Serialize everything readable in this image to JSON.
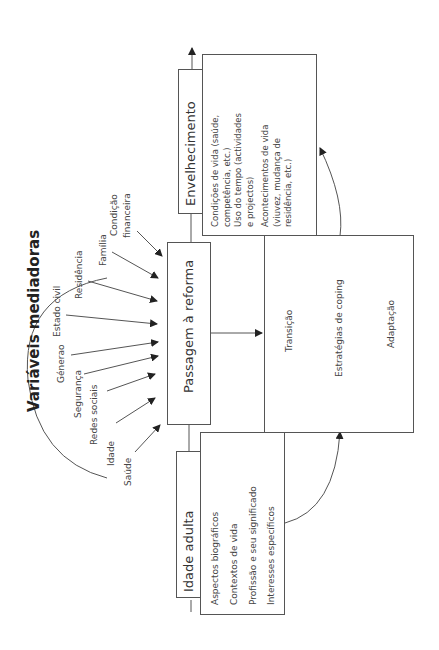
{
  "diagram": {
    "orientation": "rotated-90-ccw",
    "mediators": {
      "heading": "Variáveis mediadoras",
      "items": [
        "Saúde",
        "Idade",
        "Redes sociais",
        "Segurança",
        "Génerao",
        "Estado civil",
        "Residência",
        "Família",
        "Condição financeira"
      ]
    },
    "idade_adulta": {
      "title": "Idade adulta",
      "items": [
        "Aspectos biográficos",
        "Contextos de vida",
        "Profissão e seu significado",
        "Interesses específicos"
      ]
    },
    "passagem": {
      "title": "Passagem à reforma"
    },
    "transicao": {
      "items": [
        "Transição",
        "Estratégias de coping",
        "Adaptação"
      ]
    },
    "envelhecimento": {
      "title": "Envelhecimento",
      "lines": [
        "Condições de vida (saúde,",
        "competência, etc.)",
        "Uso do tempo (actividades",
        "e projectos)",
        "Acontecimentos de vida",
        "(viuvez, mudança de",
        "residência, etc.)"
      ]
    },
    "colors": {
      "line": "#555555",
      "text": "#333333",
      "background": "#ffffff"
    }
  }
}
